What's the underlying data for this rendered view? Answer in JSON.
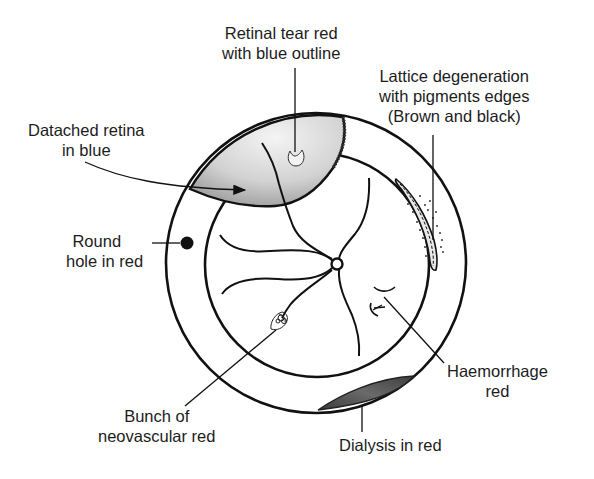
{
  "diagram": {
    "type": "retinal fundus chart (schematic)",
    "labels": {
      "retinal_tear": {
        "line1": "Retinal tear red",
        "line2": "with blue outline"
      },
      "detached_retina": {
        "line1": "Datached retina",
        "line2": "in blue"
      },
      "lattice": {
        "line1": "Lattice degeneration",
        "line2": "with pigments edges",
        "line3": "(Brown and black)"
      },
      "round_hole": {
        "line1": "Round",
        "line2": "hole in red"
      },
      "neovascular": {
        "line1": "Bunch of",
        "line2": "neovascular red"
      },
      "haemorrhage": {
        "line1": "Haemorrhage",
        "line2": "red"
      },
      "dialysis": {
        "line1": "Dialysis in red"
      }
    },
    "colors": {
      "ink": "#111111",
      "detachment_fill": "#d6d6d6",
      "detachment_fill_dark": "#9a9a9a",
      "dialysis_fill": "#555555",
      "background": "#ffffff"
    }
  }
}
